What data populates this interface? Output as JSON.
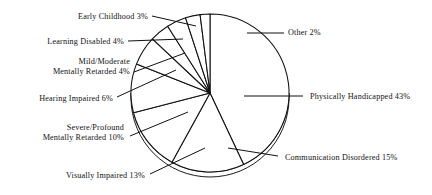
{
  "chart_data": {
    "type": "pie",
    "title": "",
    "subtitle": "",
    "xlabel": "",
    "ylabel": "",
    "legend_position": "none",
    "grid": false,
    "value_unit": "percent",
    "total": 100,
    "start_angle_deg": -90,
    "direction": "clockwise",
    "categories": [
      "Physically Handicapped",
      "Communication Disordered",
      "Visually Impaired",
      "Severe/Profound Mentally Retarded",
      "Hearing Impaired",
      "Mild/Moderate Mentally Retarded",
      "Learning Disabled",
      "Early Childhood",
      "Other"
    ],
    "values": [
      43,
      15,
      13,
      10,
      6,
      4,
      4,
      3,
      2
    ],
    "slices": [
      {
        "label": "Physically Handicapped 43%",
        "name": "Physically Handicapped",
        "value": 43,
        "label_side": "right",
        "label_lines": [
          "Physically Handicapped 43%"
        ],
        "label_x": 310,
        "label_y": 99,
        "leader": [
          [
            210,
            93
          ],
          [
            236,
            93
          ],
          [
            300,
            93
          ]
        ],
        "leader_simple": [
          [
            244,
            96
          ],
          [
            303,
            96
          ]
        ]
      },
      {
        "label": "Communication Disordered 15%",
        "name": "Communication Disordered",
        "value": 15,
        "label_side": "right",
        "label_lines": [
          "Communication Disordered 15%"
        ],
        "label_x": 285,
        "label_y": 160,
        "leader": [
          [
            225,
            150
          ],
          [
            278,
            156
          ]
        ],
        "leader_simple": [
          [
            228,
            148
          ],
          [
            278,
            156
          ]
        ]
      },
      {
        "label": "Visually Impaired 13%",
        "name": "Visually Impaired",
        "value": 13,
        "label_side": "left",
        "label_lines": [
          "Visually Impaired 13%"
        ],
        "label_x": 145,
        "label_y": 178,
        "leader": [
          [
            150,
            174
          ],
          [
            205,
            148
          ]
        ],
        "leader_simple": [
          [
            150,
            174
          ],
          [
            205,
            148
          ]
        ]
      },
      {
        "label": "Severe/Profound Mentally Retarded 10%",
        "name": "Severe/Profound Mentally Retarded",
        "value": 10,
        "label_side": "left",
        "label_lines": [
          "Severe/Profound",
          "Mentally Retarded 10%"
        ],
        "label_x": 124,
        "label_y": 130,
        "leader": [
          [
            130,
            136
          ],
          [
            188,
            112
          ]
        ],
        "leader_simple": [
          [
            130,
            136
          ],
          [
            188,
            112
          ]
        ]
      },
      {
        "label": "Hearing Impaired 6%",
        "name": "Hearing Impaired",
        "value": 6,
        "label_side": "left",
        "label_lines": [
          "Hearing Impaired 6%"
        ],
        "label_x": 113,
        "label_y": 101,
        "leader": [
          [
            117,
            97
          ],
          [
            176,
            70
          ]
        ],
        "leader_simple": [
          [
            117,
            97
          ],
          [
            176,
            70
          ]
        ]
      },
      {
        "label": "Mild/Moderate Mentally Retarded 4%",
        "name": "Mild/Moderate Mentally Retarded",
        "value": 4,
        "label_side": "left",
        "label_lines": [
          "Mild/Moderate",
          "Mentally Retarded 4%"
        ],
        "label_x": 130,
        "label_y": 64,
        "leader": [
          [
            134,
            72
          ],
          [
            185,
            53
          ]
        ],
        "leader_simple": [
          [
            134,
            72
          ],
          [
            185,
            53
          ]
        ]
      },
      {
        "label": "Learning Disabled 4%",
        "name": "Learning Disabled",
        "value": 4,
        "label_side": "left",
        "label_lines": [
          "Learning Disabled 4%"
        ],
        "label_x": 124,
        "label_y": 44,
        "leader": [
          [
            128,
            41
          ],
          [
            183,
            39
          ]
        ],
        "leader_simple": [
          [
            128,
            41
          ],
          [
            183,
            39
          ]
        ]
      },
      {
        "label": "Early Childhood 3%",
        "name": "Early Childhood",
        "value": 3,
        "label_side": "left",
        "label_lines": [
          "Early Childhood 3%"
        ],
        "label_x": 148,
        "label_y": 19,
        "leader": [
          [
            152,
            16
          ],
          [
            196,
            26
          ]
        ],
        "leader_simple": [
          [
            152,
            16
          ],
          [
            196,
            26
          ]
        ]
      },
      {
        "label": "Other 2%",
        "name": "Other",
        "value": 2,
        "label_side": "right",
        "label_lines": [
          "Other 2%"
        ],
        "label_x": 288,
        "label_y": 35,
        "leader": [
          [
            247,
            33
          ],
          [
            284,
            33
          ]
        ],
        "leader_simple": [
          [
            247,
            33
          ],
          [
            284,
            33
          ]
        ]
      }
    ],
    "geometry": {
      "center_x": 210,
      "center_y": 93,
      "radius": 79,
      "depth_offset": 5
    }
  }
}
